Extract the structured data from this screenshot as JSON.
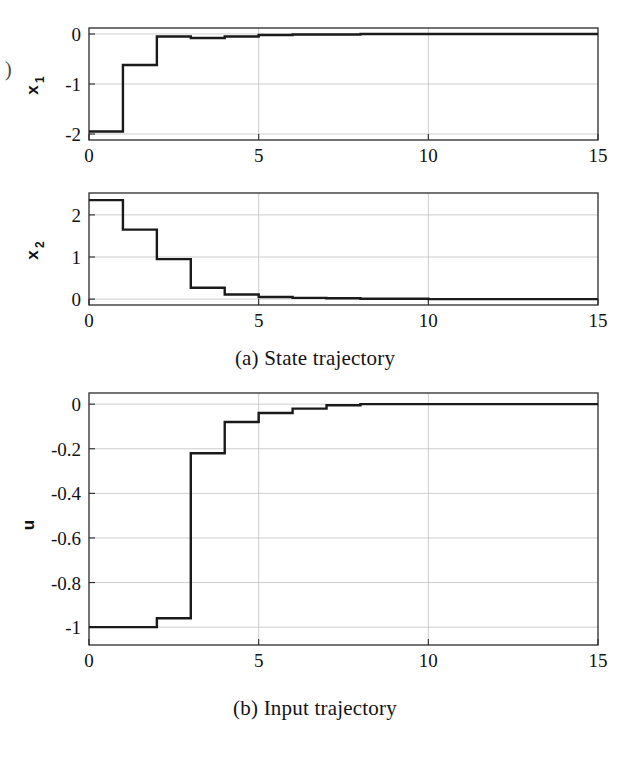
{
  "figure": {
    "captions": {
      "a": "(a) State trajectory",
      "b": "(b) Input trajectory"
    },
    "stray_mark": ")"
  },
  "chart_data": [
    {
      "id": "x1",
      "type": "line",
      "style": "step-post",
      "title": "",
      "xlabel": "Time",
      "ylabel": "x1",
      "ylabel_base": "x",
      "ylabel_sub": "1",
      "xlim": [
        0,
        15
      ],
      "ylim": [
        -2.12,
        0.12
      ],
      "xticks": [
        0,
        5,
        10,
        15
      ],
      "xticklabels": [
        "0",
        "5",
        "10",
        "15"
      ],
      "yticks": [
        0,
        -1,
        -2
      ],
      "yticklabels": [
        "0",
        "-1",
        "-2"
      ],
      "grid": true,
      "x": [
        0,
        1,
        2,
        3,
        4,
        5,
        6,
        7,
        8,
        9,
        10,
        11,
        12,
        13,
        14,
        15
      ],
      "values": [
        -1.95,
        -0.62,
        -0.05,
        -0.08,
        -0.05,
        -0.02,
        -0.01,
        -0.01,
        0.0,
        0.0,
        0.0,
        0.0,
        0.0,
        0.0,
        0.0,
        0.0
      ]
    },
    {
      "id": "x2",
      "type": "line",
      "style": "step-post",
      "title": "",
      "xlabel": "Time",
      "ylabel": "x2",
      "ylabel_base": "x",
      "ylabel_sub": "2",
      "xlim": [
        0,
        15
      ],
      "ylim": [
        -0.14,
        2.52
      ],
      "xticks": [
        0,
        5,
        10,
        15
      ],
      "xticklabels": [
        "0",
        "5",
        "10",
        "15"
      ],
      "yticks": [
        0,
        1,
        2
      ],
      "yticklabels": [
        "0",
        "1",
        "2"
      ],
      "grid": true,
      "x": [
        0,
        1,
        2,
        3,
        4,
        5,
        6,
        7,
        8,
        9,
        10,
        11,
        12,
        13,
        14,
        15
      ],
      "values": [
        2.35,
        1.65,
        0.95,
        0.27,
        0.11,
        0.05,
        0.03,
        0.02,
        0.01,
        0.01,
        0.0,
        0.0,
        0.0,
        0.0,
        0.0,
        0.0
      ]
    },
    {
      "id": "u",
      "type": "line",
      "style": "step-post",
      "title": "",
      "xlabel": "Time",
      "ylabel": "u",
      "ylabel_base": "u",
      "ylabel_sub": "",
      "xlim": [
        0,
        15
      ],
      "ylim": [
        -1.08,
        0.05
      ],
      "xticks": [
        0,
        5,
        10,
        15
      ],
      "xticklabels": [
        "0",
        "5",
        "10",
        "15"
      ],
      "yticks": [
        0,
        -0.2,
        -0.4,
        -0.6,
        -0.8,
        -1
      ],
      "yticklabels": [
        "0",
        "-0.2",
        "-0.4",
        "-0.6",
        "-0.8",
        "-1"
      ],
      "grid": true,
      "x": [
        0,
        1,
        2,
        3,
        4,
        5,
        6,
        7,
        8,
        9,
        10,
        11,
        12,
        13,
        14,
        15
      ],
      "values": [
        -1.0,
        -1.0,
        -0.96,
        -0.22,
        -0.08,
        -0.04,
        -0.02,
        -0.005,
        0.0,
        0.0,
        0.0,
        0.0,
        0.0,
        0.0,
        0.0,
        0.0
      ]
    }
  ]
}
